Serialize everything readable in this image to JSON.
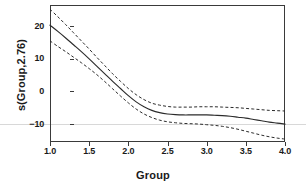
{
  "chart_data": {
    "type": "line",
    "title": "",
    "subtitle": "",
    "xlabel": "Group",
    "ylabel": "s(Group,2.76)",
    "xlim": [
      1.0,
      4.0
    ],
    "ylim": [
      -15.5,
      26.5
    ],
    "grid": false,
    "legend": null,
    "xticks": [
      "1.0",
      "1.5",
      "2.0",
      "2.5",
      "3.0",
      "3.5",
      "4.0"
    ],
    "xtick_values": [
      1.0,
      1.5,
      2.0,
      2.5,
      3.0,
      3.5,
      4.0
    ],
    "yticks": [
      "20",
      "10",
      "0",
      "−10"
    ],
    "ytick_values": [
      20,
      10,
      0,
      -10
    ],
    "x": [
      1.0,
      1.1,
      1.2,
      1.3,
      1.4,
      1.5,
      1.6,
      1.7,
      1.8,
      1.9,
      2.0,
      2.1,
      2.2,
      2.3,
      2.4,
      2.5,
      2.6,
      2.7,
      2.8,
      2.9,
      3.0,
      3.1,
      3.2,
      3.3,
      3.4,
      3.5,
      3.6,
      3.7,
      3.8,
      3.9,
      4.0
    ],
    "series": [
      {
        "name": "fit",
        "style": "solid",
        "color": "#2b2b2b",
        "values": [
          20.3,
          18.4,
          16.4,
          14.3,
          12.2,
          10.0,
          7.7,
          5.4,
          3.1,
          0.9,
          -1.3,
          -3.2,
          -4.7,
          -5.8,
          -6.5,
          -6.9,
          -7.1,
          -7.2,
          -7.2,
          -7.2,
          -7.2,
          -7.3,
          -7.4,
          -7.6,
          -7.9,
          -8.2,
          -8.6,
          -9.0,
          -9.4,
          -9.7,
          -10.0
        ]
      },
      {
        "name": "upper confidence band",
        "style": "dashed",
        "color": "#2b2b2b",
        "values": [
          25.2,
          22.9,
          20.5,
          18.0,
          15.5,
          13.0,
          10.4,
          7.9,
          5.4,
          3.1,
          0.9,
          -1.0,
          -2.5,
          -3.6,
          -4.2,
          -4.6,
          -4.8,
          -4.8,
          -4.8,
          -4.7,
          -4.7,
          -4.7,
          -4.8,
          -4.9,
          -5.0,
          -5.2,
          -5.4,
          -5.6,
          -5.8,
          -5.9,
          -6.0
        ]
      },
      {
        "name": "lower confidence band",
        "style": "dashed",
        "color": "#2b2b2b",
        "values": [
          15.5,
          13.8,
          12.2,
          10.5,
          8.8,
          7.0,
          5.1,
          3.0,
          0.8,
          -1.4,
          -3.5,
          -5.4,
          -6.9,
          -8.0,
          -8.8,
          -9.3,
          -9.6,
          -9.8,
          -9.9,
          -10.0,
          -10.2,
          -10.4,
          -10.7,
          -11.1,
          -11.6,
          -12.2,
          -12.8,
          -13.4,
          -13.9,
          -14.3,
          -14.6
        ]
      }
    ]
  },
  "colors": {
    "frame": "#3a3a3a",
    "curve": "#2b2b2b",
    "artifact_rule": "#d8d8d8",
    "background": "#ffffff"
  }
}
